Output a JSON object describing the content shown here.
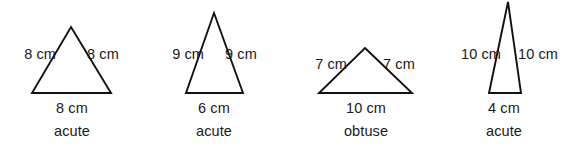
{
  "figure": {
    "background_color": "#ffffff",
    "stroke_color": "#111111",
    "text_color": "#1a1a1a",
    "unit": "cm",
    "triangles": [
      {
        "id": "triangle-1",
        "left_side_label": "8 cm",
        "right_side_label": "8 cm",
        "base_label": "8 cm",
        "classification": "acute",
        "geometry": {
          "apex_x": 71,
          "apex_y": 27,
          "base_left_x": 32,
          "base_right_x": 111,
          "base_y": 93
        },
        "labels": {
          "left": {
            "x": 2,
            "y": 47,
            "w": 54
          },
          "right": {
            "x": 87,
            "y": 47,
            "w": 54
          },
          "base": {
            "x": 36,
            "y": 101,
            "w": 72
          },
          "class": {
            "x": 32,
            "y": 124,
            "w": 80
          }
        }
      },
      {
        "id": "triangle-2",
        "left_side_label": "9 cm",
        "right_side_label": "9 cm",
        "base_label": "6 cm",
        "classification": "acute",
        "geometry": {
          "apex_x": 214,
          "apex_y": 13,
          "base_left_x": 186,
          "base_right_x": 243,
          "base_y": 93
        },
        "labels": {
          "left": {
            "x": 150,
            "y": 47,
            "w": 54
          },
          "right": {
            "x": 225,
            "y": 47,
            "w": 54
          },
          "base": {
            "x": 178,
            "y": 101,
            "w": 72
          },
          "class": {
            "x": 174,
            "y": 124,
            "w": 80
          }
        }
      },
      {
        "id": "triangle-3",
        "left_side_label": "7 cm",
        "right_side_label": "7 cm",
        "base_label": "10 cm",
        "classification": "obtuse",
        "geometry": {
          "apex_x": 365,
          "apex_y": 48,
          "base_left_x": 319,
          "base_right_x": 412,
          "base_y": 93
        },
        "labels": {
          "left": {
            "x": 293,
            "y": 57,
            "w": 54
          },
          "right": {
            "x": 383,
            "y": 57,
            "w": 54
          },
          "base": {
            "x": 329,
            "y": 101,
            "w": 74
          },
          "class": {
            "x": 325,
            "y": 124,
            "w": 82
          }
        }
      },
      {
        "id": "triangle-4",
        "left_side_label": "10 cm",
        "right_side_label": "10 cm",
        "base_label": "4 cm",
        "classification": "acute",
        "geometry": {
          "apex_x": 508,
          "apex_y": 2,
          "base_left_x": 489,
          "base_right_x": 521,
          "base_y": 93
        },
        "labels": {
          "left": {
            "x": 439,
            "y": 47,
            "w": 62
          },
          "right": {
            "x": 518,
            "y": 47,
            "w": 62
          },
          "base": {
            "x": 468,
            "y": 101,
            "w": 72
          },
          "class": {
            "x": 464,
            "y": 124,
            "w": 80
          }
        }
      }
    ]
  }
}
